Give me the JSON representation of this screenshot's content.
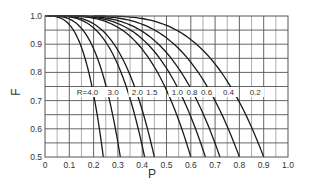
{
  "chart_data": {
    "type": "line",
    "title": "",
    "xlabel": "P",
    "ylabel": "F",
    "xlim": [
      0,
      1.0
    ],
    "ylim": [
      0.5,
      1.0
    ],
    "grid": true,
    "legend": "inline curve labels",
    "x_ticks": [
      "0",
      "0.1",
      "0.2",
      "0.3",
      "0.4",
      "0.5",
      "0.6",
      "0.7",
      "0.8",
      "0.9",
      "1.0"
    ],
    "y_ticks": [
      "0.5",
      "0.6",
      "0.7",
      "0.8",
      "0.9",
      "1.0"
    ],
    "series": [
      {
        "name": "R=4.0",
        "label": "R=4.0",
        "p_end": 0.24,
        "start_p": 0.0,
        "label_p": 0.175
      },
      {
        "name": "R=3.0",
        "label": "3.0",
        "p_end": 0.31,
        "start_p": 0.01,
        "label_p": 0.28
      },
      {
        "name": "R=2.0",
        "label": "2.0",
        "p_end": 0.41,
        "start_p": 0.02,
        "label_p": 0.38
      },
      {
        "name": "R=1.5",
        "label": "1.5",
        "p_end": 0.45,
        "start_p": 0.03,
        "label_p": 0.44
      },
      {
        "name": "R=1.0",
        "label": "1.0",
        "p_end": 0.6,
        "start_p": 0.05,
        "label_p": 0.545
      },
      {
        "name": "R=0.8",
        "label": "0.8",
        "p_end": 0.66,
        "start_p": 0.06,
        "label_p": 0.605
      },
      {
        "name": "R=0.6",
        "label": "0.6",
        "p_end": 0.72,
        "start_p": 0.08,
        "label_p": 0.665
      },
      {
        "name": "R=0.4",
        "label": "0.4",
        "p_end": 0.8,
        "start_p": 0.12,
        "label_p": 0.755
      },
      {
        "name": "R=0.2",
        "label": "0.2",
        "p_end": 0.9,
        "start_p": 0.2,
        "label_p": 0.865
      }
    ]
  },
  "axes": {
    "x_label": "P",
    "y_label": "F"
  }
}
